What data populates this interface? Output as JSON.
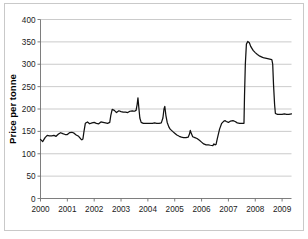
{
  "chart_data": {
    "type": "line",
    "title": "",
    "xlabel": "",
    "ylabel": "Price per tonne",
    "xlim": [
      2000.0,
      2009.35
    ],
    "ylim": [
      0,
      400
    ],
    "grid": true,
    "legend": "none",
    "y_ticks": [
      0,
      50,
      100,
      150,
      200,
      250,
      300,
      350,
      400
    ],
    "y_tick_labels": [
      "0",
      "50",
      "100",
      "150",
      "200",
      "250",
      "300",
      "350",
      "400"
    ],
    "x_ticks": [
      2000,
      2001,
      2002,
      2003,
      2004,
      2005,
      2006,
      2007,
      2008,
      2009
    ],
    "x_tick_labels": [
      "2000",
      "2001",
      "2002",
      "2003",
      "2004",
      "2005",
      "2006",
      "2007",
      "2008",
      "2009"
    ],
    "series": [
      {
        "name": "Price per tonne",
        "color": "#111111",
        "x": [
          2000.0,
          2000.08,
          2000.17,
          2000.25,
          2000.33,
          2000.42,
          2000.5,
          2000.58,
          2000.67,
          2000.75,
          2000.83,
          2000.92,
          2001.0,
          2001.08,
          2001.17,
          2001.25,
          2001.33,
          2001.42,
          2001.5,
          2001.54,
          2001.58,
          2001.62,
          2001.67,
          2001.75,
          2001.83,
          2001.92,
          2002.0,
          2002.08,
          2002.17,
          2002.25,
          2002.33,
          2002.42,
          2002.5,
          2002.58,
          2002.62,
          2002.67,
          2002.75,
          2002.83,
          2002.92,
          2003.0,
          2003.08,
          2003.17,
          2003.25,
          2003.33,
          2003.42,
          2003.5,
          2003.56,
          2003.6,
          2003.63,
          2003.66,
          2003.7,
          2003.75,
          2003.83,
          2003.92,
          2004.0,
          2004.08,
          2004.17,
          2004.25,
          2004.33,
          2004.42,
          2004.5,
          2004.56,
          2004.6,
          2004.63,
          2004.67,
          2004.72,
          2004.78,
          2004.83,
          2004.92,
          2005.0,
          2005.08,
          2005.17,
          2005.25,
          2005.33,
          2005.42,
          2005.5,
          2005.55,
          2005.58,
          2005.62,
          2005.67,
          2005.75,
          2005.83,
          2005.92,
          2006.0,
          2006.08,
          2006.17,
          2006.25,
          2006.33,
          2006.42,
          2006.46,
          2006.5,
          2006.54,
          2006.58,
          2006.67,
          2006.75,
          2006.83,
          2006.88,
          2006.92,
          2007.0,
          2007.08,
          2007.17,
          2007.25,
          2007.33,
          2007.42,
          2007.5,
          2007.55,
          2007.58,
          2007.6,
          2007.63,
          2007.67,
          2007.72,
          2007.78,
          2007.83,
          2007.92,
          2008.0,
          2008.08,
          2008.17,
          2008.25,
          2008.33,
          2008.42,
          2008.5,
          2008.58,
          2008.62,
          2008.65,
          2008.68,
          2008.72,
          2008.75,
          2008.83,
          2008.92,
          2009.0,
          2009.08,
          2009.17,
          2009.25,
          2009.35
        ],
        "y": [
          132,
          127,
          136,
          141,
          140,
          140,
          141,
          139,
          144,
          147,
          145,
          143,
          143,
          147,
          148,
          146,
          142,
          139,
          133,
          131,
          133,
          150,
          168,
          171,
          167,
          169,
          170,
          168,
          167,
          171,
          170,
          169,
          168,
          170,
          186,
          199,
          197,
          192,
          196,
          194,
          193,
          193,
          192,
          195,
          196,
          195,
          197,
          210,
          225,
          205,
          180,
          170,
          168,
          168,
          168,
          168,
          168,
          169,
          168,
          168,
          169,
          180,
          200,
          206,
          186,
          170,
          160,
          155,
          150,
          146,
          142,
          139,
          137,
          136,
          136,
          137,
          144,
          152,
          145,
          138,
          136,
          134,
          130,
          126,
          122,
          120,
          120,
          119,
          118,
          122,
          120,
          121,
          132,
          155,
          168,
          173,
          174,
          172,
          170,
          173,
          174,
          172,
          169,
          168,
          168,
          168,
          168,
          230,
          300,
          345,
          351,
          348,
          340,
          331,
          326,
          322,
          318,
          316,
          314,
          313,
          312,
          311,
          310,
          300,
          255,
          210,
          190,
          188,
          188,
          188,
          189,
          188,
          188,
          189
        ]
      }
    ]
  },
  "axis": {
    "y_title": "Price per tonne"
  }
}
